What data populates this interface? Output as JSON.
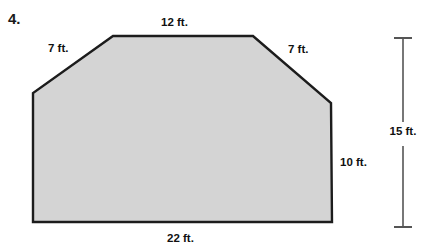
{
  "problem": {
    "number": "4."
  },
  "figure": {
    "shape_name": "hexagon",
    "fill_color": "#d4d4d4",
    "stroke_color": "#1c1c1c",
    "vertices": [
      [
        33,
        222
      ],
      [
        33,
        93
      ],
      [
        113,
        36
      ],
      [
        253,
        36
      ],
      [
        331,
        103
      ],
      [
        332,
        222
      ]
    ],
    "labels": {
      "top": "12 ft.",
      "left_slant": "7 ft.",
      "right_slant": "7 ft.",
      "right_side": "10 ft.",
      "bottom": "22 ft.",
      "overall_height": "15 ft."
    }
  },
  "dimension_line": {
    "name": "overall-height",
    "value": "15 ft.",
    "x": 403,
    "top_y": 38,
    "bottom_y": 227,
    "tick_half_width": 9,
    "color": "#555555"
  }
}
